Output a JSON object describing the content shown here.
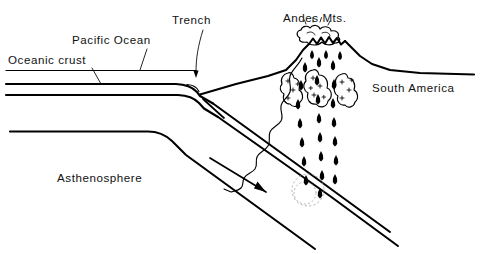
{
  "figure": {
    "kind": "geology-cross-section",
    "title_visible": false,
    "background_color": "#ffffff",
    "ink_color": "#000000",
    "width": 480,
    "height": 254
  },
  "labels": {
    "oceanic_crust": "Oceanic crust",
    "pacific_ocean": "Pacific Ocean",
    "trench": "Trench",
    "andes_mts": "Andes Mts.",
    "south_america": "South America",
    "asthenosphere": "Asthenosphere"
  },
  "label_positions": {
    "oceanic_crust": {
      "x": 8,
      "y": 64
    },
    "pacific_ocean": {
      "x": 72,
      "y": 44
    },
    "trench": {
      "x": 172,
      "y": 24
    },
    "andes_mts": {
      "x": 283,
      "y": 22
    },
    "south_america": {
      "x": 372,
      "y": 92
    },
    "asthenosphere": {
      "x": 57,
      "y": 182
    }
  },
  "features": [
    {
      "name": "sea-surface-line",
      "description": "Horizontal ocean surface line running from left margin to the trench"
    },
    {
      "name": "oceanic-crust-slab",
      "description": "Double-line oceanic plate that flattens westward and bends down at the trench into the mantle"
    },
    {
      "name": "trench-notch",
      "description": "V-shaped depression where the oceanic plate begins subducting beneath the continent"
    },
    {
      "name": "continental-wedge",
      "description": "Triangular South American continental block with a wavy basal contact above the descending slab"
    },
    {
      "name": "lithosphere-base-line",
      "description": "Lower boundary of the oceanic lithosphere bending down-right parallel to the slab"
    },
    {
      "name": "subduction-motion-arrow",
      "description": "Arrow within the asthenosphere indicating down-dip plate motion toward the lower right"
    },
    {
      "name": "melting-zone",
      "description": "Faint dotted circle on the slab marking where partial melting generates magma"
    },
    {
      "name": "magma-rise-arrows",
      "description": "Column of small dark teardrop arrows rising from the slab to the volcano summit"
    },
    {
      "name": "magma-bodies",
      "description": "Three irregular outlined plutons with plus-sign stipple in the continental crust"
    },
    {
      "name": "volcano-summit",
      "description": "Jagged Andean peaks at the top of the continental block"
    },
    {
      "name": "eruption-cloud",
      "description": "Puffy ash plume drawn above the summit crater"
    }
  ],
  "leaders": [
    {
      "name": "leader-oceanic-crust",
      "from_label": "oceanic_crust",
      "points_to": "oceanic-crust-slab"
    },
    {
      "name": "leader-pacific-ocean",
      "from_label": "pacific_ocean",
      "points_to": "sea-surface-line"
    },
    {
      "name": "leader-trench",
      "from_label": "trench",
      "points_to": "trench-notch"
    }
  ]
}
